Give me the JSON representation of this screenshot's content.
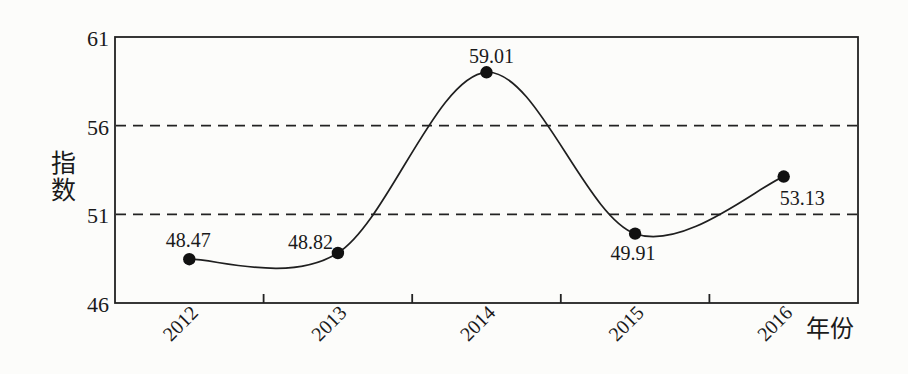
{
  "chart_data": {
    "type": "line",
    "title": "",
    "xlabel": "年份",
    "ylabel": "指数",
    "categories": [
      "2012",
      "2013",
      "2014",
      "2015",
      "2016"
    ],
    "values": [
      48.47,
      48.82,
      59.01,
      49.91,
      53.13
    ],
    "point_labels": [
      "48.47",
      "48.82",
      "59.01",
      "49.91",
      "53.13"
    ],
    "ylim": [
      46,
      61
    ],
    "yticks": [
      61,
      56,
      51,
      46
    ],
    "dashed_gridlines": [
      56,
      51
    ],
    "legend": "none",
    "grid": "horizontal dashed reference lines only",
    "marker": "filled-circle",
    "colors": {
      "line": "#1f1f1f",
      "marker": "#111111",
      "text": "#1a1a1a",
      "frame": "#222222",
      "background": "#fcfcfa"
    }
  }
}
